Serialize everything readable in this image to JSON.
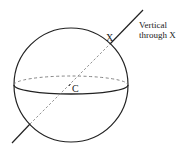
{
  "diagram": {
    "type": "sphere-with-vertical-line",
    "labels": {
      "point_x": "X",
      "center": "C",
      "line_label_line1": "Vertical",
      "line_label_line2": "through X"
    },
    "colors": {
      "stroke": "#222222",
      "dashed": "#888888",
      "background": "#ffffff"
    }
  }
}
